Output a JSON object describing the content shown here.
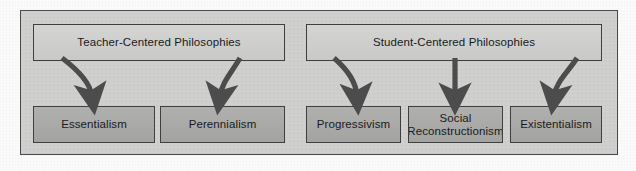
{
  "diagram": {
    "title_alt": "Educational Philosophies",
    "panel": {
      "background_color": "#d0d0cf",
      "border_color": "#4a4a4a"
    },
    "colors": {
      "header_box": "#cdcdcc",
      "child_box": "#a9a9a8",
      "box_border": "#3f3f3f",
      "arrow": "#4c4c4c",
      "text": "#1a1a1a"
    },
    "groups": [
      {
        "id": "teacher-centered",
        "header": {
          "label": "Teacher-Centered Philosophies",
          "x": 33,
          "y": 24,
          "width": 252,
          "height": 37
        },
        "children": [
          {
            "id": "essentialism",
            "label": "Essentialism",
            "x": 33,
            "y": 106,
            "width": 122,
            "height": 37,
            "arrow": {
              "type": "curved-right",
              "from_x": 63,
              "from_y": 60,
              "to_x": 92,
              "to_y": 104
            }
          },
          {
            "id": "perennialism",
            "label": "Perennialism",
            "x": 160,
            "y": 106,
            "width": 125,
            "height": 37,
            "arrow": {
              "type": "curved-left",
              "from_x": 239,
              "from_y": 60,
              "to_x": 218,
              "to_y": 104
            }
          }
        ]
      },
      {
        "id": "student-centered",
        "header": {
          "label": "Student-Centered Philosophies",
          "x": 306,
          "y": 24,
          "width": 296,
          "height": 37
        },
        "children": [
          {
            "id": "progressivism",
            "label": "Progressivism",
            "x": 306,
            "y": 106,
            "width": 95,
            "height": 37,
            "arrow": {
              "type": "curved-right",
              "from_x": 334,
              "from_y": 60,
              "to_x": 357,
              "to_y": 104
            }
          },
          {
            "id": "social-reconstructionism",
            "label": "Social\nReconstructionism",
            "x": 408,
            "y": 106,
            "width": 95,
            "height": 37,
            "arrow": {
              "type": "straight",
              "from_x": 455,
              "from_y": 60,
              "to_x": 455,
              "to_y": 104
            }
          },
          {
            "id": "existentialism",
            "label": "Existentialism",
            "x": 510,
            "y": 106,
            "width": 92,
            "height": 37,
            "arrow": {
              "type": "curved-left",
              "from_x": 576,
              "from_y": 60,
              "to_x": 553,
              "to_y": 104
            }
          }
        ]
      }
    ]
  }
}
